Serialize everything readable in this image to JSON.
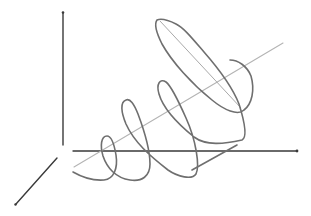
{
  "diagram": {
    "title": "",
    "colors": {
      "axis": "#3a3a3a",
      "guide_line": "#b4b4b4",
      "spiral": "#6f6f6f",
      "background": "#ffffff"
    },
    "axes": [
      {
        "name": "vertical-axis",
        "from": [
          63,
          145
        ],
        "to": [
          63,
          12
        ]
      },
      {
        "name": "horizontal-axis",
        "from": [
          73,
          151
        ],
        "to": [
          297,
          151
        ]
      },
      {
        "name": "depth-axis",
        "from": [
          57,
          158
        ],
        "to": [
          15,
          205
        ]
      }
    ],
    "helix_axis": {
      "from": [
        73,
        167
      ],
      "to": [
        283,
        43
      ]
    },
    "labels": []
  }
}
